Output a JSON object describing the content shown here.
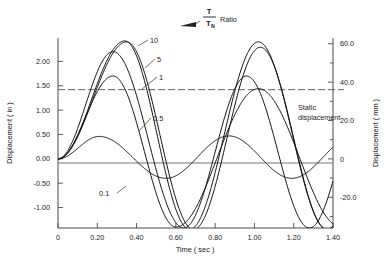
{
  "chart_data": {
    "type": "line",
    "title": "",
    "xlabel": "Time  ( sec )",
    "ylabel": "Displacement  ( in )",
    "ylabel_right": "Displacement  ( mm )",
    "xlim": [
      0,
      1.4
    ],
    "ylim": [
      -1.42,
      2.48
    ],
    "ylim_right": [
      -36.0,
      63.0
    ],
    "grid": false,
    "legend_position": "inline-labels",
    "xticks": [
      "0",
      "0.20",
      "0.40",
      "0.60",
      "0.80",
      "1.00",
      "1.20",
      "1.40"
    ],
    "xtick_values": [
      0,
      0.2,
      0.4,
      0.6,
      0.8,
      1.0,
      1.2,
      1.4
    ],
    "yticks": [
      "2.00",
      "1.50",
      "1.00",
      "0.50",
      "0.00",
      "-0.50",
      "-1.00"
    ],
    "ytick_values": [
      2.0,
      1.5,
      1.0,
      0.5,
      0.0,
      -0.5,
      -1.0
    ],
    "yticks_right": [
      "60.0",
      "40.0",
      "20.0",
      "0",
      "-20.0"
    ],
    "ytick_values_right": [
      60.0,
      40.0,
      20.0,
      0.0,
      -20.0
    ],
    "annotations": [
      {
        "name": "ratio-title",
        "numerator": "T",
        "denominator": "T",
        "denominator_sub": "N",
        "suffix": "Ratio"
      },
      {
        "name": "static-displacement",
        "line1": "Static",
        "line2": "displacement",
        "value_in": 1.42,
        "value_mm": 36.0
      }
    ],
    "series": [
      {
        "name": "10",
        "label": "10",
        "peak1": 2.42,
        "peak1_t": 0.34,
        "trough": -1.45,
        "trough_t": 0.67,
        "peak2": 2.4,
        "peak2_t": 1.02
      },
      {
        "name": "5",
        "label": "5",
        "peak1": 2.4,
        "peak1_t": 0.35,
        "trough": -1.45,
        "trough_t": 0.69,
        "peak2": 2.29,
        "peak2_t": 1.03
      },
      {
        "name": "1",
        "label": "1",
        "peak1": 2.2,
        "peak1_t": 0.28,
        "trough": -1.42,
        "trough_t": 0.64,
        "peak2": 1.7,
        "peak2_t": 0.96
      },
      {
        "name": "0.5",
        "label": "0.5",
        "peak1": 1.7,
        "peak1_t": 0.28,
        "trough": -1.4,
        "trough_t": 0.6,
        "peak2": 1.44,
        "peak2_t": 1.02
      },
      {
        "name": "0.1",
        "label": "0.1",
        "peak1": 0.46,
        "peak1_t": 0.21,
        "trough": -0.4,
        "trough_t": 0.55,
        "peak2": 0.47,
        "peak2_t": 0.87
      }
    ]
  }
}
